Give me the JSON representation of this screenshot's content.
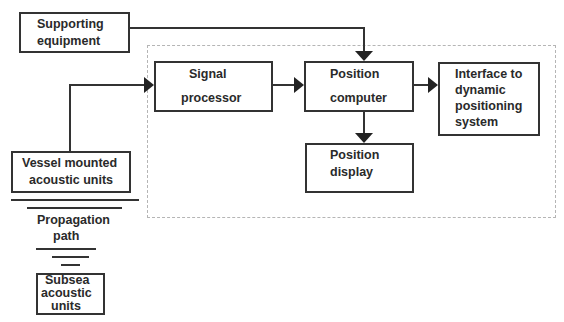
{
  "diagram": {
    "nodes": {
      "supporting_equipment": {
        "line1": "Supporting",
        "line2": "equipment"
      },
      "signal_processor": {
        "line1": "Signal",
        "line2": "processor"
      },
      "position_computer": {
        "line1": "Position",
        "line2": "computer"
      },
      "interface": {
        "line1": "Interface to",
        "line2": "dynamic",
        "line3": "positioning",
        "line4": "system"
      },
      "position_display": {
        "line1": "Position",
        "line2": "display"
      },
      "vessel_units": {
        "line1": "Vessel mounted",
        "line2": "acoustic units"
      },
      "propagation_path": {
        "line1": "Propagation",
        "line2": "path"
      },
      "subsea_units": {
        "line1": "Subsea",
        "line2": "acoustic",
        "line3": "units"
      }
    },
    "edges": [
      {
        "from": "supporting_equipment",
        "to": "position_computer"
      },
      {
        "from": "vessel_units",
        "to": "signal_processor"
      },
      {
        "from": "signal_processor",
        "to": "position_computer"
      },
      {
        "from": "position_computer",
        "to": "interface"
      },
      {
        "from": "position_computer",
        "to": "position_display"
      }
    ],
    "colors": {
      "line": "#333333",
      "dashed_border": "#b5b5b5",
      "background": "#ffffff"
    }
  }
}
